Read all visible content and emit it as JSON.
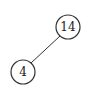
{
  "diagram": {
    "type": "binary-tree",
    "nodes": [
      {
        "id": "n14",
        "label": "14",
        "cx": 68,
        "cy": 27,
        "r": 12
      },
      {
        "id": "n4",
        "label": "4",
        "cx": 23,
        "cy": 72,
        "r": 12
      }
    ],
    "edges": [
      {
        "from": "n14",
        "to": "n4"
      }
    ],
    "colors": {
      "stroke": "#333333",
      "fill": "#ffffff",
      "text": "#222222"
    }
  }
}
